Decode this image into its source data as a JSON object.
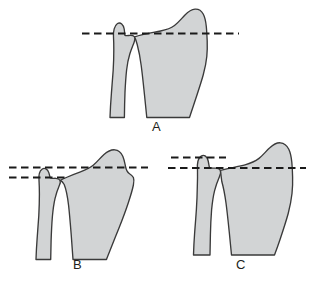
{
  "figure": {
    "kind": "anatomical-line-illustration",
    "background_color": "#ffffff",
    "bone_fill_color": "#d2d4d5",
    "bone_outline_color": "#3a3a3a",
    "dashed_line_color": "#1a1a1a",
    "label_color": "#231f20",
    "panel_count": 3
  },
  "panels": [
    {
      "id": "A",
      "label": "A",
      "label_x": 152,
      "label_y": 120,
      "description": "neutral ulnar variance - single reference line through both bone tips",
      "reference_lines": [
        {
          "name": "neutral-line",
          "x1": 82,
          "x2": 239,
          "y": 33,
          "length_class": "long"
        }
      ],
      "bones": [
        {
          "name": "ulna",
          "side": "left"
        },
        {
          "name": "radius",
          "side": "right"
        }
      ]
    },
    {
      "id": "B",
      "label": "B",
      "label_x": 73,
      "label_y": 258,
      "description": "negative ulnar variance - ulna tip sits below radius reference line",
      "reference_lines": [
        {
          "name": "radius-line",
          "x1": 9,
          "x2": 148,
          "y": 167,
          "length_class": "long"
        },
        {
          "name": "ulna-line",
          "x1": 9,
          "x2": 66,
          "y": 177,
          "length_class": "short"
        }
      ],
      "bones": [
        {
          "name": "ulna",
          "side": "left"
        },
        {
          "name": "radius",
          "side": "right"
        }
      ]
    },
    {
      "id": "C",
      "label": "C",
      "label_x": 236,
      "label_y": 258,
      "description": "positive ulnar variance - ulna tip sits above radius reference line",
      "reference_lines": [
        {
          "name": "ulna-line",
          "x1": 171,
          "x2": 226,
          "y": 157,
          "length_class": "short"
        },
        {
          "name": "radius-line",
          "x1": 168,
          "x2": 306,
          "y": 168,
          "length_class": "long"
        }
      ],
      "bones": [
        {
          "name": "ulna",
          "side": "left"
        },
        {
          "name": "radius",
          "side": "right"
        }
      ]
    }
  ]
}
